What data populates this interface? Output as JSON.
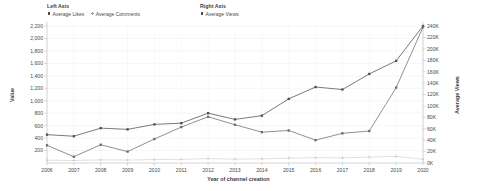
{
  "legend": {
    "groups": [
      {
        "title": "Left Axis",
        "entries": [
          {
            "label": "Average Likes",
            "marker": "square",
            "color": "#4d4d4d"
          },
          {
            "label": "Average Comments",
            "marker": "plus",
            "color": "#9a9a9a"
          }
        ]
      },
      {
        "title": "Right Axis",
        "entries": [
          {
            "label": "Average Views",
            "marker": "square",
            "color": "#4d4d4d"
          }
        ]
      }
    ]
  },
  "chart_data": {
    "type": "line",
    "title": "",
    "xlabel": "Year of channel creation",
    "ylabel": "Value",
    "y2label": "Average Views",
    "grid": true,
    "legend_position": "top",
    "categories": [
      "2006",
      "2007",
      "2008",
      "2009",
      "2010",
      "2011",
      "2012",
      "2013",
      "2014",
      "2015",
      "2016",
      "2017",
      "2018",
      "2019",
      "2020"
    ],
    "xlim": [
      2006,
      2020
    ],
    "ylim": [
      0,
      2200
    ],
    "y2lim": [
      0,
      240000
    ],
    "ytick_labels": [
      "2,200",
      "2,000",
      "1,800",
      "1,600",
      "1,400",
      "1,200",
      "1,000",
      "800",
      "600",
      "400",
      "200"
    ],
    "ytick_values": [
      2200,
      2000,
      1800,
      1600,
      1400,
      1200,
      1000,
      800,
      600,
      400,
      200
    ],
    "y2tick_labels": [
      "240K",
      "220K",
      "200K",
      "180K",
      "160K",
      "140K",
      "120K",
      "100K",
      "80K",
      "60K",
      "40K",
      "20K",
      "0K"
    ],
    "y2tick_values": [
      240000,
      220000,
      200000,
      180000,
      160000,
      140000,
      120000,
      100000,
      80000,
      60000,
      40000,
      20000,
      0
    ],
    "series": [
      {
        "name": "Average Likes",
        "axis": "left",
        "color": "#4d4d4d",
        "marker": "square",
        "values": [
          455,
          430,
          560,
          540,
          620,
          640,
          800,
          700,
          760,
          1030,
          1220,
          1180,
          1430,
          1640,
          2200
        ]
      },
      {
        "name": "Average Comments",
        "axis": "left",
        "color": "#c3c3c3",
        "marker": "plus",
        "values": [
          45,
          40,
          50,
          48,
          55,
          58,
          70,
          62,
          66,
          78,
          85,
          82,
          95,
          105,
          60
        ]
      },
      {
        "name": "Average Views",
        "axis": "right",
        "color": "#6b6b6b",
        "marker": "square",
        "values": [
          31000,
          11000,
          32000,
          20000,
          42000,
          63000,
          81000,
          67000,
          54000,
          57000,
          40000,
          52000,
          56000,
          132000,
          238000
        ]
      }
    ]
  }
}
